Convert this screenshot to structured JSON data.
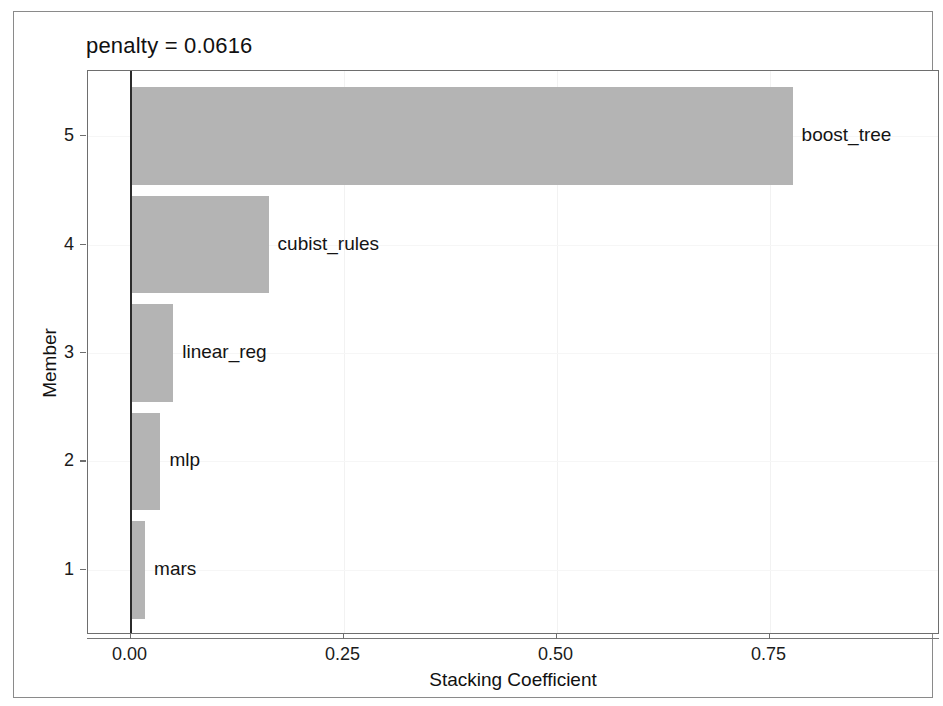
{
  "figure": {
    "title": "penalty = 0.0616",
    "background_color": "#ffffff",
    "frame_color": "#8a8a8a",
    "panel_border_color": "#6e6e6e"
  },
  "chart_data": {
    "type": "bar",
    "orientation": "horizontal",
    "title": "penalty = 0.0616",
    "xlabel": "Stacking Coefficient",
    "ylabel": "Member",
    "xlim": [
      -0.05,
      0.95
    ],
    "ylim": [
      0.4,
      5.6
    ],
    "grid": true,
    "legend": "none",
    "bar_color": "#b4b4b4",
    "zero_line_color": "#2b2b2b",
    "categories": [
      1,
      2,
      3,
      4,
      5
    ],
    "category_labels": [
      "1",
      "2",
      "3",
      "4",
      "5"
    ],
    "point_labels": [
      "mars",
      "mlp",
      "linear_reg",
      "cubist_rules",
      "boost_tree"
    ],
    "values": [
      0.017,
      0.035,
      0.05,
      0.162,
      0.777
    ],
    "xticks": [
      0.0,
      0.25,
      0.5,
      0.75
    ],
    "xtick_labels": [
      "0.00",
      "0.25",
      "0.50",
      "0.75"
    ],
    "yticks": [
      1,
      2,
      3,
      4,
      5
    ],
    "ytick_labels": [
      "1",
      "2",
      "3",
      "4",
      "5"
    ],
    "bars": [
      {
        "member": 5,
        "label": "boost_tree",
        "value": 0.777
      },
      {
        "member": 4,
        "label": "cubist_rules",
        "value": 0.162
      },
      {
        "member": 3,
        "label": "linear_reg",
        "value": 0.05
      },
      {
        "member": 2,
        "label": "mlp",
        "value": 0.035
      },
      {
        "member": 1,
        "label": "mars",
        "value": 0.017
      }
    ]
  }
}
